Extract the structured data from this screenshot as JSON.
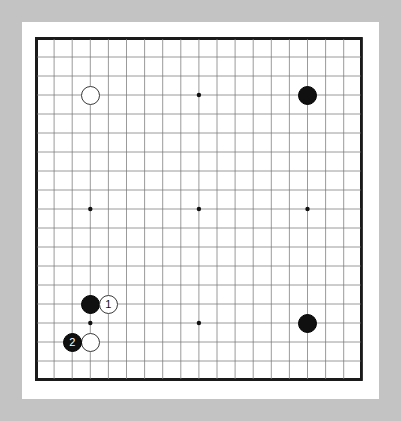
{
  "app": {
    "title": "Go Board Diagram",
    "kind": "go-game-position"
  },
  "board": {
    "size": 19,
    "label": "19x19 Go board",
    "background_color": "#ffffff",
    "line_color": "#7a7a7a",
    "border_color": "#1a1a1a",
    "frame_color": "#c3c3c3",
    "paper_color": "#ffffff",
    "origin_x": 36,
    "origin_y": 38,
    "cell_w": 18.1,
    "cell_h": 19.0,
    "stone_radius": 9.5,
    "star_radius": 2.2,
    "star_points": [
      [
        3,
        3
      ],
      [
        9,
        3
      ],
      [
        15,
        3
      ],
      [
        3,
        9
      ],
      [
        9,
        9
      ],
      [
        15,
        9
      ],
      [
        3,
        15
      ],
      [
        9,
        15
      ],
      [
        15,
        15
      ]
    ]
  },
  "stones": [
    {
      "name": "white-stone-top-left",
      "color": "white",
      "col": 3,
      "row": 3,
      "label": ""
    },
    {
      "name": "black-stone-top-right",
      "color": "black",
      "col": 15,
      "row": 3,
      "label": ""
    },
    {
      "name": "black-stone-bottom-right",
      "color": "black",
      "col": 15,
      "row": 15,
      "label": ""
    },
    {
      "name": "black-stone-lower-left",
      "color": "black",
      "col": 3,
      "row": 14,
      "label": ""
    },
    {
      "name": "white-move-1",
      "color": "white",
      "col": 4,
      "row": 14,
      "label": "1"
    },
    {
      "name": "white-stone-lower-left",
      "color": "white",
      "col": 3,
      "row": 16,
      "label": ""
    },
    {
      "name": "black-move-2",
      "color": "black",
      "col": 2,
      "row": 16,
      "label": "2"
    }
  ],
  "moves": [
    {
      "number": "1",
      "color": "white"
    },
    {
      "number": "2",
      "color": "black"
    }
  ]
}
